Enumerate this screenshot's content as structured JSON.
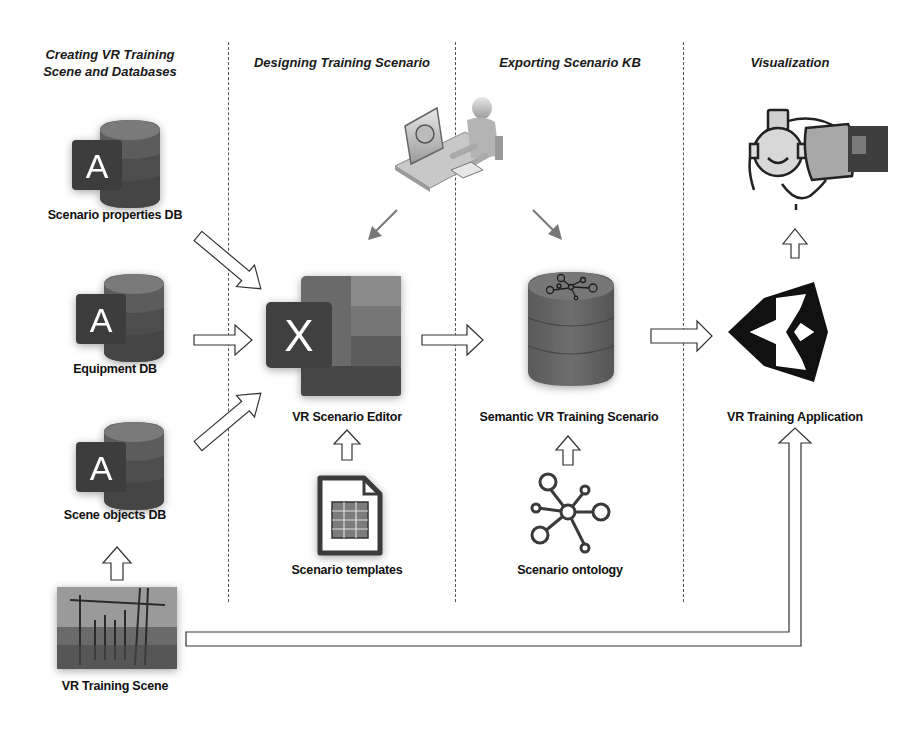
{
  "columns": [
    {
      "id": "creating",
      "title_line1": "Creating VR Training",
      "title_line2": "Scene and Databases"
    },
    {
      "id": "designing",
      "title": "Designing Training Scenario"
    },
    {
      "id": "exporting",
      "title": "Exporting Scenario KB"
    },
    {
      "id": "visualization",
      "title": "Visualization"
    }
  ],
  "nodes": {
    "scenario_properties_db": {
      "label": "Scenario properties DB",
      "icon": "access-database-icon",
      "glyph": "A"
    },
    "equipment_db": {
      "label": "Equipment DB",
      "icon": "access-database-icon",
      "glyph": "A"
    },
    "scene_objects_db": {
      "label": "Scene objects DB",
      "icon": "access-database-icon",
      "glyph": "A"
    },
    "vr_training_scene": {
      "label": "VR Training Scene",
      "icon": "substation-photo"
    },
    "vr_scenario_editor": {
      "label": "VR Scenario Editor",
      "icon": "excel-icon",
      "glyph": "X"
    },
    "scenario_templates": {
      "label": "Scenario templates",
      "icon": "spreadsheet-file-icon"
    },
    "user_at_computer": {
      "icon": "user-at-computer-icon"
    },
    "semantic_vr_training_scenario": {
      "label": "Semantic VR Training Scenario",
      "icon": "knowledge-base-database-icon"
    },
    "scenario_ontology": {
      "label": "Scenario ontology",
      "icon": "ontology-graph-icon"
    },
    "vr_training_application": {
      "label": "VR Training Application",
      "icon": "unity-logo-icon"
    },
    "vr_headset_user": {
      "icon": "vr-headset-icon"
    }
  },
  "edges": [
    {
      "from": "scenario_properties_db",
      "to": "vr_scenario_editor"
    },
    {
      "from": "equipment_db",
      "to": "vr_scenario_editor"
    },
    {
      "from": "scene_objects_db",
      "to": "vr_scenario_editor"
    },
    {
      "from": "vr_training_scene",
      "to": "scene_objects_db"
    },
    {
      "from": "scenario_templates",
      "to": "vr_scenario_editor"
    },
    {
      "from": "user_at_computer",
      "to": "vr_scenario_editor"
    },
    {
      "from": "user_at_computer",
      "to": "semantic_vr_training_scenario"
    },
    {
      "from": "vr_scenario_editor",
      "to": "semantic_vr_training_scenario"
    },
    {
      "from": "scenario_ontology",
      "to": "semantic_vr_training_scenario"
    },
    {
      "from": "semantic_vr_training_scenario",
      "to": "vr_training_application"
    },
    {
      "from": "vr_training_application",
      "to": "vr_headset_user"
    },
    {
      "from": "vr_training_scene",
      "to": "vr_training_application"
    }
  ],
  "colors": {
    "background": "#ffffff",
    "icon_dark": "#3a3a3a",
    "icon_mid": "#5e5e5e",
    "icon_light": "#8a8a8a",
    "divider": "#555555"
  }
}
